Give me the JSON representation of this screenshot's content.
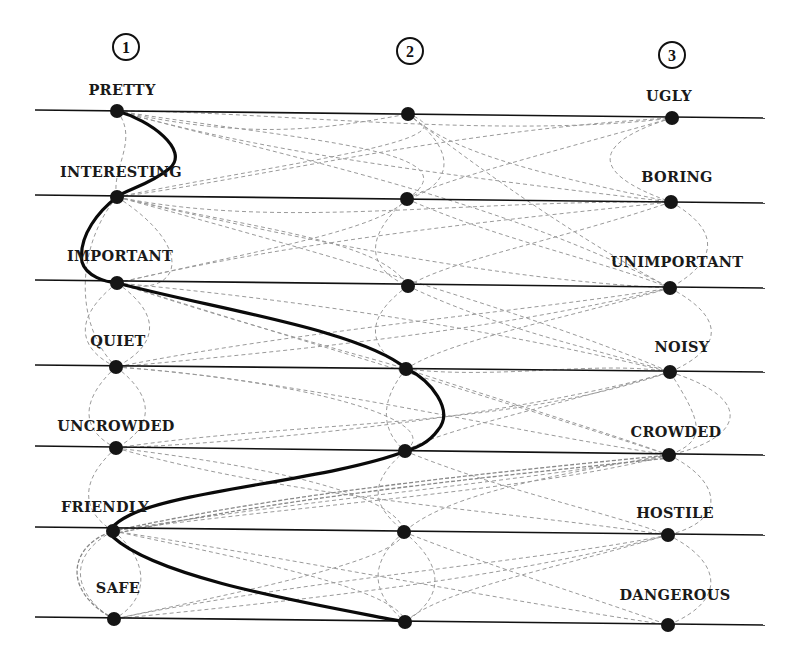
{
  "diagram": {
    "columns": [
      {
        "number": "1",
        "cx": 126,
        "cy": 47
      },
      {
        "number": "2",
        "cx": 410,
        "cy": 51
      },
      {
        "number": "3",
        "cx": 672,
        "cy": 55
      }
    ],
    "scales": [
      {
        "left_label": "PRETTY",
        "right_label": "UGLY",
        "y_left": 110,
        "y_right": 118,
        "left_lx": 122,
        "left_ly": 95,
        "right_lx": 669,
        "right_ly": 101
      },
      {
        "left_label": "INTERESTING",
        "right_label": "BORING",
        "y_left": 195,
        "y_right": 203,
        "left_lx": 121,
        "left_ly": 177,
        "right_lx": 677,
        "right_ly": 182
      },
      {
        "left_label": "IMPORTANT",
        "right_label": "UNIMPORTANT",
        "y_left": 280,
        "y_right": 288,
        "left_lx": 120,
        "left_ly": 261,
        "right_lx": 677,
        "right_ly": 267
      },
      {
        "left_label": "QUIET",
        "right_label": "NOISY",
        "y_left": 365,
        "y_right": 372,
        "left_lx": 118,
        "left_ly": 346,
        "right_lx": 682,
        "right_ly": 352
      },
      {
        "left_label": "UNCROWDED",
        "right_label": "CROWDED",
        "y_left": 446,
        "y_right": 455,
        "left_lx": 116,
        "left_ly": 431,
        "right_lx": 676,
        "right_ly": 437
      },
      {
        "left_label": "FRIENDLY",
        "right_label": "HOSTILE",
        "y_left": 527,
        "y_right": 535,
        "left_lx": 105,
        "left_ly": 512,
        "right_lx": 675,
        "right_ly": 518
      },
      {
        "left_label": "SAFE",
        "right_label": "DANGEROUS",
        "y_left": 617,
        "y_right": 625,
        "left_lx": 118,
        "left_ly": 593,
        "right_lx": 675,
        "right_ly": 600
      }
    ],
    "line_x_start": 35,
    "line_x_end": 765,
    "dots": [
      [
        117,
        111
      ],
      [
        408,
        114
      ],
      [
        672,
        118
      ],
      [
        117,
        197
      ],
      [
        407,
        199
      ],
      [
        671,
        202
      ],
      [
        117,
        283
      ],
      [
        408,
        286
      ],
      [
        670,
        288
      ],
      [
        116,
        367
      ],
      [
        406,
        369
      ],
      [
        670,
        372
      ],
      [
        116,
        448
      ],
      [
        405,
        451
      ],
      [
        669,
        455
      ],
      [
        113,
        531
      ],
      [
        404,
        532
      ],
      [
        668,
        535
      ],
      [
        114,
        619
      ],
      [
        405,
        622
      ],
      [
        668,
        625
      ]
    ],
    "profile_path": "M117,111 C150,120 190,150 170,168 C150,185 125,190 117,197 C100,210 78,235 82,262 C86,276 105,282 117,283 C220,310 360,330 407,369 C430,380 455,410 438,430 C428,444 415,448 406,451 C330,480 180,490 130,515 C110,525 108,532 113,537 C160,580 320,605 405,622",
    "dashed_paths": [
      "M117,111 C250,140 320,130 408,114",
      "M117,111 C250,110 500,140 672,118",
      "M117,111 C260,150 400,170 671,202",
      "M117,111 C300,140 480,150 407,199",
      "M117,111 C300,160 500,200 670,288",
      "M117,111 C140,140 110,170 117,197",
      "M117,197 C250,180 450,130 672,118",
      "M117,197 C300,160 480,140 408,114",
      "M117,197 C280,230 450,200 671,202",
      "M117,197 C260,230 380,240 408,286",
      "M117,197 C300,240 500,280 670,288",
      "M117,197 C350,260 550,320 670,372",
      "M117,197 C200,250 180,300 117,283",
      "M117,197 C80,240 70,320 116,367",
      "M408,114 C450,150 520,170 671,202",
      "M408,114 C470,160 440,190 407,199",
      "M408,114 C520,200 600,250 670,288",
      "M672,118 C600,140 580,170 671,202",
      "M672,118 C560,150 440,180 407,199",
      "M671,202 C720,230 720,260 670,288",
      "M671,202 C560,240 450,260 408,286",
      "M407,199 C500,240 600,260 670,288",
      "M407,199 C360,240 370,270 408,286",
      "M117,283 C300,240 500,220 671,202",
      "M117,283 C260,250 380,230 407,199",
      "M117,283 C300,300 500,330 670,372",
      "M117,283 C260,330 380,360 406,369",
      "M117,283 C70,320 80,350 116,367",
      "M117,283 C170,320 150,350 116,367",
      "M117,283 C300,340 500,400 669,455",
      "M408,286 C500,330 600,350 670,372",
      "M408,286 C360,320 370,350 406,369",
      "M670,288 C560,320 450,340 406,369",
      "M670,288 C730,320 720,350 670,372",
      "M670,288 C540,310 300,330 116,367",
      "M116,367 C300,380 500,430 669,455",
      "M116,367 C300,380 450,420 405,451",
      "M116,367 C300,350 500,330 670,288",
      "M116,367 C80,400 80,430 116,448",
      "M116,367 C160,400 150,430 116,448",
      "M406,369 C500,400 600,430 669,455",
      "M406,369 C380,400 380,430 405,451",
      "M406,369 C500,380 600,360 670,372",
      "M670,372 C760,400 740,440 669,455",
      "M670,372 C700,420 710,440 669,455",
      "M670,372 C540,410 300,440 116,448",
      "M670,372 C540,410 440,430 405,451",
      "M116,448 C300,420 500,430 670,372",
      "M116,448 C300,500 500,510 668,535",
      "M116,448 C300,470 400,500 404,532",
      "M116,448 C80,480 80,510 113,531",
      "M405,451 C360,490 380,510 404,532",
      "M405,451 C500,490 600,510 668,535",
      "M669,455 C720,480 730,520 668,535",
      "M669,455 C540,480 300,500 113,531",
      "M669,455 C540,490 300,505 113,531",
      "M669,455 C520,480 440,500 404,532",
      "M113,531 C60,560 80,600 114,619",
      "M113,531 C150,560 150,600 114,619",
      "M113,531 C250,560 400,590 405,622",
      "M113,531 C300,560 500,600 668,625",
      "M404,532 C360,570 380,600 405,622",
      "M404,532 C450,570 440,600 405,622",
      "M404,532 C500,570 600,600 668,625",
      "M668,535 C720,560 730,600 668,625",
      "M668,535 C550,560 300,580 114,619",
      "M668,535 C550,570 440,590 405,622",
      "M114,619 C250,590 400,560 404,532",
      "M114,619 C300,600 500,580 668,535"
    ],
    "dashed_dark_paths": [
      "M113,531 C300,490 520,470 669,455",
      "M113,534 C300,494 520,474 669,458",
      "M114,619 C60,590 70,545 113,531"
    ]
  }
}
